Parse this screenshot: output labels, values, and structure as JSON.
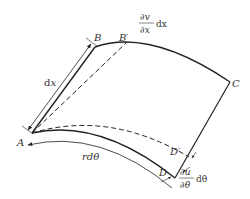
{
  "diagram": {
    "type": "deformed curved shell element",
    "points": {
      "A": {
        "label": "A",
        "x": 32,
        "y": 133
      },
      "B": {
        "label": "B",
        "x": 95,
        "y": 47
      },
      "B_prime": {
        "label": "B′",
        "x": 127,
        "y": 42
      },
      "C": {
        "label": "C",
        "x": 230,
        "y": 82
      },
      "D": {
        "label": "D",
        "x": 175,
        "y": 178
      },
      "D_prime": {
        "label": "D′",
        "x": 189,
        "y": 157
      }
    },
    "labels": {
      "dx": {
        "d": "d",
        "var": "x"
      },
      "rdtheta": "rdθ",
      "dv_dx": {
        "num": "∂v",
        "den": "∂x",
        "suffix": "dx"
      },
      "du_dtheta": {
        "num": "∂u",
        "den": "∂θ",
        "suffix": "dθ"
      }
    },
    "edges": [
      {
        "from": "A",
        "to": "B",
        "style": "solid"
      },
      {
        "from": "B",
        "to": "C",
        "style": "solid-arc"
      },
      {
        "from": "C",
        "to": "D",
        "style": "solid"
      },
      {
        "from": "A",
        "to": "D",
        "style": "solid-arc"
      },
      {
        "from": "A",
        "to": "B_prime",
        "style": "dashed"
      },
      {
        "from": "A",
        "to": "D_prime",
        "style": "dashed-arc"
      }
    ],
    "colors": {
      "line": "#222222",
      "text": "#333333",
      "background": "#ffffff"
    }
  }
}
